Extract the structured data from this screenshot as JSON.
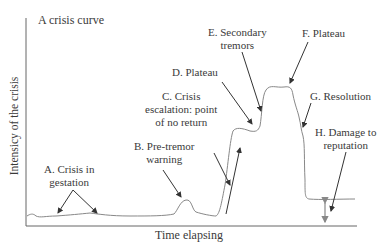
{
  "title": "A crisis curve",
  "axes": {
    "ylabel": "Intensicy of the crisis",
    "xlabel": "Time elapsing"
  },
  "labels": {
    "a": {
      "line1": "A. Crisis in",
      "line2": "gestation"
    },
    "b": {
      "line1": "B. Pre-tremor",
      "line2": "warning"
    },
    "c": {
      "line1": "C. Crisis",
      "line2": "escalation: point",
      "line3": "of no return"
    },
    "d": {
      "line1": "D. Plateau"
    },
    "e": {
      "line1": "E. Secondary",
      "line2": "tremors"
    },
    "f": {
      "line1": "F. Plateau"
    },
    "g": {
      "line1": "G. Resolution"
    },
    "h": {
      "line1": "H. Damage to",
      "line2": "reputation"
    }
  },
  "colors": {
    "line": "#555555",
    "curve": "#777777",
    "arrow": "#333333"
  }
}
